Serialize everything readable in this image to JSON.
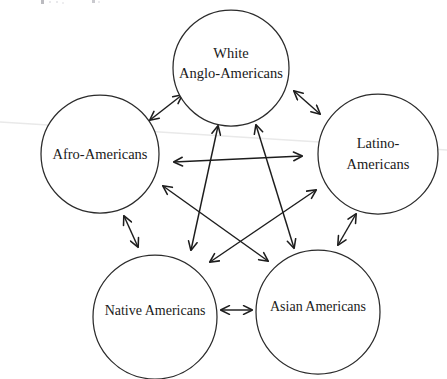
{
  "diagram": {
    "background_color": "#ffffff",
    "stroke_color": "#2b2b2b",
    "arrow_color": "#1d1d1d",
    "text_color": "#1a1a1a",
    "width": 447,
    "height": 379,
    "nodes": [
      {
        "id": "white-anglo-americans",
        "label_line1": "White",
        "label_line2": "Anglo-Americans",
        "cx": 231,
        "cy": 68,
        "r": 58,
        "lines": 2
      },
      {
        "id": "afro-americans",
        "label_line1": "Afro-Americans",
        "label_line2": "",
        "cx": 100,
        "cy": 154,
        "r": 59,
        "lines": 1
      },
      {
        "id": "latino-americans",
        "label_line1": "Latino-",
        "label_line2": "Americans",
        "cx": 378,
        "cy": 154,
        "r": 60,
        "lines": 2
      },
      {
        "id": "native-americans",
        "label_line1": "Native Americans",
        "label_line2": "",
        "cx": 155,
        "cy": 317,
        "r": 62,
        "lines": 1
      },
      {
        "id": "asian-americans",
        "label_line1": "Asian Americans",
        "label_line2": "",
        "cx": 318,
        "cy": 312,
        "r": 62,
        "lines": 1
      }
    ],
    "edges": [
      {
        "id": "afro-to-white",
        "from": "afro-americans",
        "to": "white-anglo-americans",
        "kind": "perimeter",
        "bidirectional": true,
        "x1": 150,
        "y1": 120,
        "x2": 182,
        "y2": 95
      },
      {
        "id": "white-to-latino",
        "from": "white-anglo-americans",
        "to": "latino-americans",
        "kind": "perimeter",
        "bidirectional": true,
        "x1": 294,
        "y1": 91,
        "x2": 320,
        "y2": 114
      },
      {
        "id": "latino-to-asian",
        "from": "latino-americans",
        "to": "asian-americans",
        "kind": "perimeter",
        "bidirectional": true,
        "x1": 356,
        "y1": 214,
        "x2": 338,
        "y2": 245
      },
      {
        "id": "asian-to-native",
        "from": "asian-americans",
        "to": "native-americans",
        "kind": "perimeter",
        "bidirectional": true,
        "x1": 252,
        "y1": 310,
        "x2": 221,
        "y2": 310
      },
      {
        "id": "native-to-afro",
        "from": "native-americans",
        "to": "afro-americans",
        "kind": "perimeter",
        "bidirectional": true,
        "x1": 138,
        "y1": 247,
        "x2": 124,
        "y2": 216
      },
      {
        "id": "afro-to-latino",
        "from": "afro-americans",
        "to": "latino-americans",
        "kind": "diagonal",
        "bidirectional": true,
        "x1": 174,
        "y1": 162,
        "x2": 302,
        "y2": 156
      },
      {
        "id": "native-to-white",
        "from": "native-americans",
        "to": "white-anglo-americans",
        "kind": "diagonal",
        "bidirectional": true,
        "x1": 191,
        "y1": 250,
        "x2": 218,
        "y2": 126
      },
      {
        "id": "asian-to-white",
        "from": "asian-americans",
        "to": "white-anglo-americans",
        "kind": "diagonal",
        "bidirectional": true,
        "x1": 294,
        "y1": 248,
        "x2": 256,
        "y2": 125
      },
      {
        "id": "afro-to-asian",
        "from": "afro-americans",
        "to": "asian-americans",
        "kind": "diagonal",
        "bidirectional": true,
        "x1": 163,
        "y1": 186,
        "x2": 268,
        "y2": 261
      },
      {
        "id": "native-to-latino",
        "from": "native-americans",
        "to": "latino-americans",
        "kind": "diagonal",
        "bidirectional": true,
        "x1": 210,
        "y1": 262,
        "x2": 316,
        "y2": 190
      }
    ],
    "artifacts": {
      "scan_line_color": "#e9e9e9",
      "scan_line_x1": 0,
      "scan_line_y1": 122,
      "scan_line_x2": 447,
      "scan_line_y2": 150,
      "clipped_header_text": ""
    }
  }
}
